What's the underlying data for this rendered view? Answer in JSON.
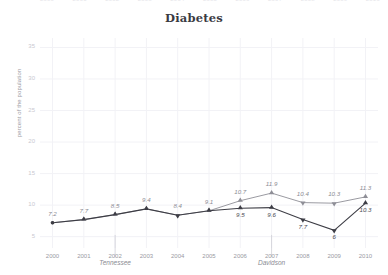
{
  "top_strip": {
    "years": [
      "2000",
      "2001",
      "2002",
      "2003",
      "2004",
      "2005",
      "2006",
      "2007",
      "2008",
      "2009",
      "2010"
    ]
  },
  "chart_data": {
    "type": "line",
    "title": "Diabetes",
    "xlabel": "",
    "ylabel": "percent of the population",
    "x": [
      2000,
      2001,
      2002,
      2003,
      2004,
      2005,
      2006,
      2007,
      2008,
      2009,
      2010
    ],
    "xtick_labels": [
      "2000",
      "2001",
      "2002",
      "2003",
      "2004",
      "2005",
      "2006",
      "2007",
      "2008",
      "2009",
      "2010"
    ],
    "ytick_labels": [
      "5",
      "10",
      "15",
      "20",
      "25",
      "30",
      "35"
    ],
    "yticks": [
      5,
      10,
      15,
      20,
      25,
      30,
      35
    ],
    "ylim": [
      3.2,
      36.5
    ],
    "xlim": [
      1999.6,
      2010.4
    ],
    "grid": true,
    "legend": "inline-annotation",
    "series": [
      {
        "name": "Tennessee",
        "color": "#8e8e96",
        "marker": "triangle-up",
        "values": [
          7.2,
          7.7,
          8.5,
          9.4,
          8.4,
          9.1,
          10.7,
          11.9,
          10.4,
          10.3,
          11.3
        ],
        "labels": [
          "7.2",
          "7.7",
          "8.5",
          "9.4",
          "8.4",
          "9.1",
          "10.7",
          "11.9",
          "10.4",
          "10.3",
          "11.3"
        ]
      },
      {
        "name": "Davidson",
        "color": "#3d3d45",
        "marker": "triangle-up",
        "values": [
          7.2,
          7.7,
          8.5,
          9.4,
          8.4,
          9.1,
          9.5,
          9.6,
          7.7,
          6.0,
          10.3
        ],
        "labels": [
          "7.2",
          "7.7",
          "8.5",
          "9.4",
          "8.4",
          "9.1",
          "9.5",
          "9.6",
          "7.7",
          "6",
          "10.3"
        ]
      }
    ],
    "annotations": [
      {
        "text": "Tennessee",
        "x": 2002,
        "y": 4.0
      },
      {
        "text": "Davidson",
        "x": 2007,
        "y": 4.0
      }
    ]
  },
  "colors": {
    "background": "#ffffff",
    "grid": "#f2f2f6",
    "axis_text": "#9a9aa3",
    "title": "#3a3a42",
    "series_light": "#8e8e96",
    "series_dark": "#3d3d45"
  }
}
